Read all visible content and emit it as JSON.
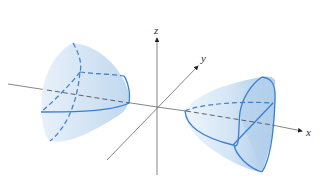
{
  "figure": {
    "type": "3d-surface-diagram",
    "surface": "hyperboloid of two sheets along x-axis",
    "axes": {
      "x_label": "x",
      "y_label": "y",
      "z_label": "z"
    },
    "colors": {
      "surface_fill": "#cfe2f3",
      "surface_shade": "#a9c9ea",
      "trace_line": "#3a7fcf",
      "axis_line": "#555555",
      "background": "#ffffff"
    }
  }
}
